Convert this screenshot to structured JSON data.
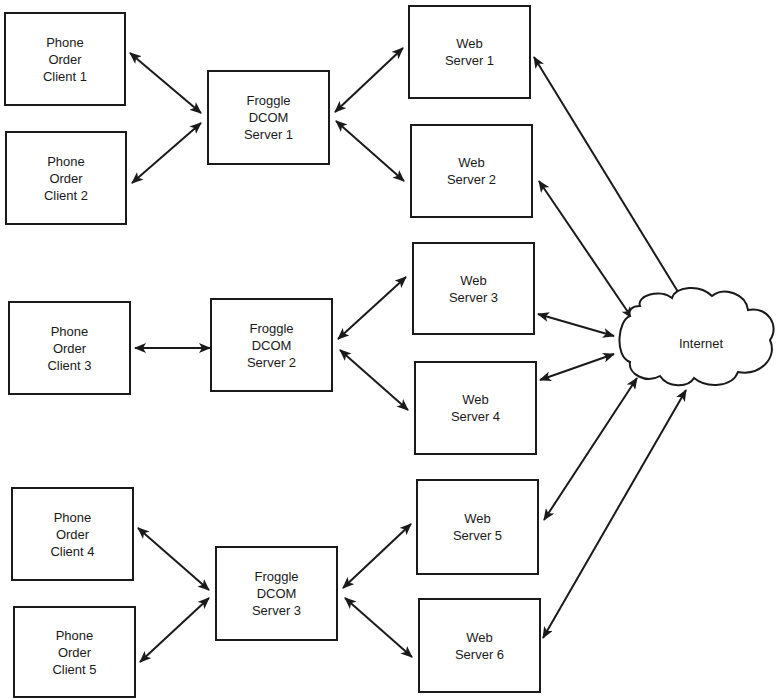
{
  "diagram": {
    "stroke_color": "#1a1a1a",
    "background": "#ffffff",
    "nodes": [
      {
        "id": "client1",
        "label": "Phone\nOrder\nClient 1",
        "x": 4,
        "y": 12,
        "w": 122,
        "h": 94
      },
      {
        "id": "client2",
        "label": "Phone\nOrder\nClient 2",
        "x": 5,
        "y": 131,
        "w": 122,
        "h": 94
      },
      {
        "id": "client3",
        "label": "Phone\nOrder\nClient 3",
        "x": 8,
        "y": 301,
        "w": 123,
        "h": 94
      },
      {
        "id": "client4",
        "label": "Phone\nOrder\nClient 4",
        "x": 11,
        "y": 487,
        "w": 123,
        "h": 94
      },
      {
        "id": "client5",
        "label": "Phone\nOrder\nClient 5",
        "x": 13,
        "y": 606,
        "w": 123,
        "h": 92
      },
      {
        "id": "dcom1",
        "label": "Froggle\nDCOM\nServer 1",
        "x": 207,
        "y": 70,
        "w": 123,
        "h": 95
      },
      {
        "id": "dcom2",
        "label": "Froggle\nDCOM\nServer 2",
        "x": 210,
        "y": 298,
        "w": 123,
        "h": 94
      },
      {
        "id": "dcom3",
        "label": "Froggle\nDCOM\nServer 3",
        "x": 215,
        "y": 546,
        "w": 123,
        "h": 95
      },
      {
        "id": "web1",
        "label": "Web\nServer 1",
        "x": 408,
        "y": 5,
        "w": 123,
        "h": 94
      },
      {
        "id": "web2",
        "label": "Web\nServer 2",
        "x": 410,
        "y": 124,
        "w": 123,
        "h": 94
      },
      {
        "id": "web3",
        "label": "Web\nServer 3",
        "x": 412,
        "y": 242,
        "w": 123,
        "h": 93
      },
      {
        "id": "web4",
        "label": "Web\nServer 4",
        "x": 414,
        "y": 361,
        "w": 123,
        "h": 94
      },
      {
        "id": "web5",
        "label": "Web\nServer 5",
        "x": 416,
        "y": 479,
        "w": 123,
        "h": 96
      },
      {
        "id": "web6",
        "label": "Web\nServer 6",
        "x": 418,
        "y": 598,
        "w": 123,
        "h": 95
      }
    ],
    "cloud": {
      "id": "internet",
      "label": "Internet",
      "x": 618,
      "y": 291,
      "w": 158,
      "h": 95
    },
    "edges": [
      {
        "from": "client1",
        "to": "dcom1",
        "x1": 130,
        "y1": 53,
        "x2": 201,
        "y2": 113,
        "bidirectional": true
      },
      {
        "from": "client2",
        "to": "dcom1",
        "x1": 132,
        "y1": 183,
        "x2": 201,
        "y2": 123,
        "bidirectional": true
      },
      {
        "from": "client3",
        "to": "dcom2",
        "x1": 135,
        "y1": 348,
        "x2": 210,
        "y2": 348,
        "bidirectional": true
      },
      {
        "from": "client4",
        "to": "dcom3",
        "x1": 138,
        "y1": 528,
        "x2": 209,
        "y2": 590,
        "bidirectional": true
      },
      {
        "from": "client5",
        "to": "dcom3",
        "x1": 140,
        "y1": 662,
        "x2": 209,
        "y2": 598,
        "bidirectional": true
      },
      {
        "from": "dcom1",
        "to": "web1",
        "x1": 335,
        "y1": 112,
        "x2": 403,
        "y2": 48,
        "bidirectional": true
      },
      {
        "from": "dcom1",
        "to": "web2",
        "x1": 336,
        "y1": 121,
        "x2": 404,
        "y2": 181,
        "bidirectional": true
      },
      {
        "from": "dcom2",
        "to": "web3",
        "x1": 338,
        "y1": 339,
        "x2": 406,
        "y2": 277,
        "bidirectional": true
      },
      {
        "from": "dcom2",
        "to": "web4",
        "x1": 340,
        "y1": 350,
        "x2": 408,
        "y2": 410,
        "bidirectional": true
      },
      {
        "from": "dcom3",
        "to": "web5",
        "x1": 343,
        "y1": 588,
        "x2": 411,
        "y2": 524,
        "bidirectional": true
      },
      {
        "from": "dcom3",
        "to": "web6",
        "x1": 345,
        "y1": 598,
        "x2": 412,
        "y2": 657,
        "bidirectional": true
      },
      {
        "from": "web1",
        "to": "internet",
        "x1": 534,
        "y1": 57,
        "x2": 683,
        "y2": 300,
        "bidirectional": true
      },
      {
        "from": "web2",
        "to": "internet",
        "x1": 539,
        "y1": 181,
        "x2": 632,
        "y2": 318,
        "bidirectional": true
      },
      {
        "from": "web3",
        "to": "internet",
        "x1": 538,
        "y1": 314,
        "x2": 614,
        "y2": 336,
        "bidirectional": true
      },
      {
        "from": "web4",
        "to": "internet",
        "x1": 540,
        "y1": 380,
        "x2": 614,
        "y2": 354,
        "bidirectional": true
      },
      {
        "from": "web5",
        "to": "internet",
        "x1": 544,
        "y1": 520,
        "x2": 637,
        "y2": 378,
        "bidirectional": true
      },
      {
        "from": "web6",
        "to": "internet",
        "x1": 543,
        "y1": 638,
        "x2": 686,
        "y2": 390,
        "bidirectional": true
      }
    ]
  }
}
